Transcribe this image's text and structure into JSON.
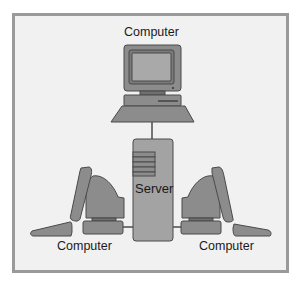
{
  "diagram": {
    "type": "network-topology",
    "nodes": [
      {
        "id": "top-computer",
        "label": "Computer",
        "kind": "desktop-computer"
      },
      {
        "id": "server",
        "label": "Server",
        "kind": "server-tower"
      },
      {
        "id": "left-computer",
        "label": "Computer",
        "kind": "desktop-computer"
      },
      {
        "id": "right-computer",
        "label": "Computer",
        "kind": "desktop-computer"
      }
    ],
    "edges": [
      {
        "from": "top-computer",
        "to": "server"
      },
      {
        "from": "left-computer",
        "to": "server"
      },
      {
        "from": "right-computer",
        "to": "server"
      }
    ],
    "colors": {
      "frame_border": "#9a9a9a",
      "frame_fill": "#f1f1f1",
      "device_fill": "#8c8c8c",
      "device_dark": "#6f6f6f",
      "device_stroke": "#4a4a4a",
      "screen_fill": "#a9a9a9",
      "connector": "#222222"
    }
  },
  "labels": {
    "top": "Computer",
    "server": "Server",
    "left": "Computer",
    "right": "Computer"
  }
}
